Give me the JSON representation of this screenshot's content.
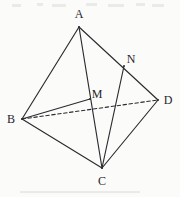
{
  "figure": {
    "width": 180,
    "height": 197,
    "background_color": "#fbfbfa",
    "stroke_color": "#2b2b30",
    "label_color": "#26262a",
    "vertices": [
      {
        "id": "A",
        "label": "A",
        "x": 79,
        "y": 27,
        "label_x": 79,
        "label_y": 14
      },
      {
        "id": "B",
        "label": "B",
        "x": 22,
        "y": 119,
        "label_x": 11,
        "label_y": 119
      },
      {
        "id": "C",
        "label": "C",
        "x": 102,
        "y": 168,
        "label_x": 102,
        "label_y": 181
      },
      {
        "id": "D",
        "label": "D",
        "x": 158,
        "y": 100,
        "label_x": 168,
        "label_y": 100
      },
      {
        "id": "M",
        "label": "M",
        "x": 90,
        "y": 99,
        "label_x": 97,
        "label_y": 94
      },
      {
        "id": "N",
        "label": "N",
        "x": 124,
        "y": 66,
        "label_x": 131,
        "label_y": 59
      }
    ],
    "edges": [
      {
        "name": "edge-AB",
        "from": "A",
        "to": "B",
        "style": "solid"
      },
      {
        "name": "edge-AC",
        "from": "A",
        "to": "C",
        "style": "solid"
      },
      {
        "name": "edge-AD",
        "from": "A",
        "to": "D",
        "style": "solid"
      },
      {
        "name": "edge-BC",
        "from": "B",
        "to": "C",
        "style": "solid"
      },
      {
        "name": "edge-CD",
        "from": "C",
        "to": "D",
        "style": "solid"
      },
      {
        "name": "edge-BD",
        "from": "B",
        "to": "D",
        "style": "dashed"
      },
      {
        "name": "segment-BM",
        "from": "B",
        "to": "M",
        "style": "solid"
      },
      {
        "name": "segment-NC",
        "from": "N",
        "to": "C",
        "style": "solid"
      }
    ],
    "stroke_width": 1.15,
    "dash_pattern": "3.5 2.5"
  }
}
